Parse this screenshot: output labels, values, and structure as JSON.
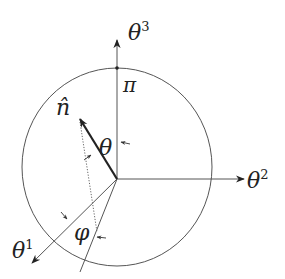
{
  "diagram": {
    "labels": {
      "theta3": "θ",
      "theta3_sup": "3",
      "theta2": "θ",
      "theta2_sup": "2",
      "theta1": "θ",
      "theta1_sup": "1",
      "pi": "π",
      "n_hat": "n̂",
      "theta": "θ",
      "phi": "φ"
    },
    "geometry": {
      "origin": [
        117,
        179
      ],
      "circle_center": [
        117,
        167
      ],
      "circle_rx": 95,
      "circle_ry": 99,
      "axes": {
        "theta3_tip": [
          117,
          40
        ],
        "theta2_tip": [
          243,
          179
        ],
        "theta1_tip": [
          33,
          262
        ]
      },
      "n_hat_tip": [
        80,
        120
      ],
      "projection_foot": [
        96,
        232
      ],
      "phi_line_end": [
        80,
        270
      ]
    },
    "colors": {
      "line": "#555555",
      "vector": "#222222",
      "text": "#222222",
      "background": "#ffffff"
    }
  }
}
